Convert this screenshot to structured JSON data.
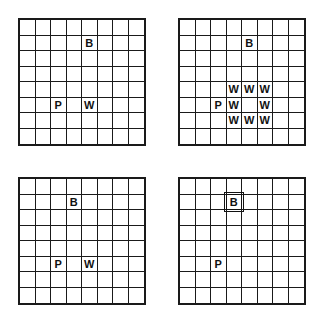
{
  "diagram": {
    "grid_size": 8,
    "panels": [
      {
        "id": "top-left",
        "position": {
          "x": 18,
          "y": 18
        },
        "items": [
          {
            "label": "B",
            "row": 1,
            "col": 4
          },
          {
            "label": "P",
            "row": 5,
            "col": 2
          },
          {
            "label": "W",
            "row": 5,
            "col": 4
          }
        ]
      },
      {
        "id": "top-right",
        "position": {
          "x": 178,
          "y": 18
        },
        "items": [
          {
            "label": "B",
            "row": 1,
            "col": 4
          },
          {
            "label": "W",
            "row": 4,
            "col": 3
          },
          {
            "label": "W",
            "row": 4,
            "col": 4
          },
          {
            "label": "W",
            "row": 4,
            "col": 5
          },
          {
            "label": "P",
            "row": 5,
            "col": 2
          },
          {
            "label": "W",
            "row": 5,
            "col": 3
          },
          {
            "label": "W",
            "row": 5,
            "col": 5
          },
          {
            "label": "W",
            "row": 6,
            "col": 3
          },
          {
            "label": "W",
            "row": 6,
            "col": 4
          },
          {
            "label": "W",
            "row": 6,
            "col": 5
          }
        ]
      },
      {
        "id": "bottom-left",
        "position": {
          "x": 18,
          "y": 177
        },
        "items": [
          {
            "label": "B",
            "row": 1,
            "col": 3
          },
          {
            "label": "P",
            "row": 5,
            "col": 2
          },
          {
            "label": "W",
            "row": 5,
            "col": 4
          }
        ]
      },
      {
        "id": "bottom-right",
        "position": {
          "x": 178,
          "y": 177
        },
        "items": [
          {
            "label": "B",
            "row": 1,
            "col": 3,
            "highlighted": true
          },
          {
            "label": "P",
            "row": 5,
            "col": 2
          }
        ]
      }
    ]
  }
}
